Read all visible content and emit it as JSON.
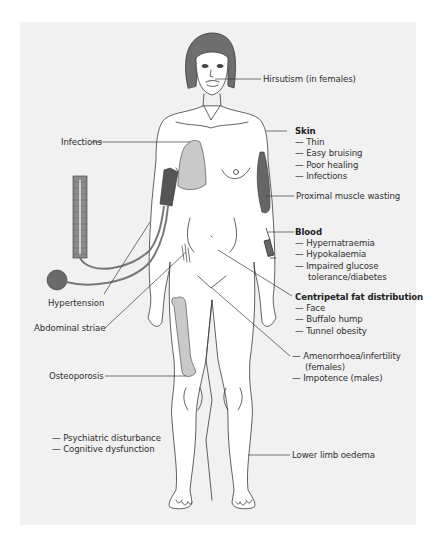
{
  "figure": {
    "background_color": "#f1f1f1",
    "shading_color": "#c9c9c9",
    "dark_color": "#555555",
    "line_color": "#3a3a3a"
  },
  "labels": {
    "hirsutism": "Hirsutism (in females)",
    "infections": "Infections",
    "skin": {
      "title": "Skin",
      "items": [
        "Thin",
        "Easy bruising",
        "Poor healing",
        "Infections"
      ]
    },
    "proximal_muscle": "Proximal muscle wasting",
    "blood": {
      "title": "Blood",
      "items": [
        "Hypernatraemia",
        "Hypokalaemia",
        "Impaired glucose"
      ],
      "continuation": "tolerance/diabetes"
    },
    "centripetal": {
      "title": "Centripetal fat distribution",
      "items": [
        "Face",
        "Buffalo hump",
        "Tunnel obesity"
      ]
    },
    "reproductive": {
      "items": [
        "Amenorrhoea/infertility"
      ],
      "continuation": "(females)",
      "items2": [
        "Impotence (males)"
      ]
    },
    "hypertension": "Hypertension",
    "abdominal_striae": "Abdominal striae",
    "osteoporosis": "Osteoporosis",
    "psych": {
      "items": [
        "Psychiatric disturbance",
        "Cognitive dysfunction"
      ]
    },
    "lower_limb": "Lower limb oedema"
  }
}
